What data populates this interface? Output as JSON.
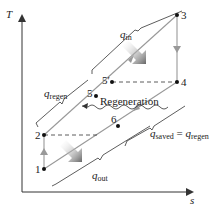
{
  "diagram": {
    "type": "T-s diagram",
    "axes": {
      "y_label": "T",
      "x_label": "s"
    },
    "points": [
      {
        "id": "1",
        "label": "1"
      },
      {
        "id": "2",
        "label": "2"
      },
      {
        "id": "3",
        "label": "3"
      },
      {
        "id": "4",
        "label": "4"
      },
      {
        "id": "5",
        "label": "5"
      },
      {
        "id": "5p",
        "label": "5′"
      },
      {
        "id": "6",
        "label": "6"
      }
    ],
    "labels": {
      "q_in": {
        "main": "q",
        "sub": "in"
      },
      "q_out": {
        "main": "q",
        "sub": "out"
      },
      "q_regen": {
        "main": "q",
        "sub": "regen"
      },
      "q_saved": {
        "main": "q",
        "sub": "saved",
        "eq": " = ",
        "main2": "q",
        "sub2": "regen"
      },
      "regeneration": "Regeneration"
    },
    "colors": {
      "line": "#333333",
      "process": "#999999",
      "arrow_shade": "#777777"
    }
  }
}
